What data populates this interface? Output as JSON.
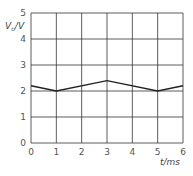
{
  "chart_data": {
    "type": "line",
    "title": "",
    "xlabel": "t/ms",
    "ylabel": "V_o/V",
    "ylabel_main": "V",
    "ylabel_sub": "o",
    "ylabel_unit": "/V",
    "xlim": [
      0,
      6
    ],
    "ylim": [
      0,
      5
    ],
    "grid": true,
    "x_ticks": [
      "0",
      "1",
      "2",
      "3",
      "4",
      "5",
      "6"
    ],
    "y_ticks": [
      "0",
      "1",
      "2",
      "3",
      "4",
      "5"
    ],
    "series": [
      {
        "name": "V_o",
        "x": [
          0,
          1,
          3,
          5,
          6
        ],
        "values": [
          2.2,
          2.0,
          2.4,
          2.0,
          2.2
        ]
      }
    ]
  },
  "colors": {
    "grid": "#333333",
    "line": "#222222",
    "text": "#555555"
  }
}
